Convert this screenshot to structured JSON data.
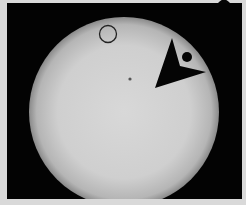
{
  "image": {
    "subject": "Transit of Venus across the Sun",
    "background_color": "#d9d9d9",
    "frame_color": "#030303",
    "sun": {
      "cx": 124,
      "cy": 112,
      "r": 95,
      "center_color": "#d6d6d6",
      "edge_color": "#8a8a8a"
    },
    "venus": {
      "cx": 187,
      "cy": 57,
      "r": 5,
      "color": "#050505"
    },
    "sunspot": {
      "cx": 130,
      "cy": 79,
      "r": 1.5,
      "color": "#555555"
    },
    "annotation_circle": {
      "cx": 108,
      "cy": 34,
      "r": 9,
      "stroke": "#222222"
    },
    "annotation_arrow": {
      "points": "172,38 180,64 205,72 155,88",
      "color": "#050505"
    }
  }
}
